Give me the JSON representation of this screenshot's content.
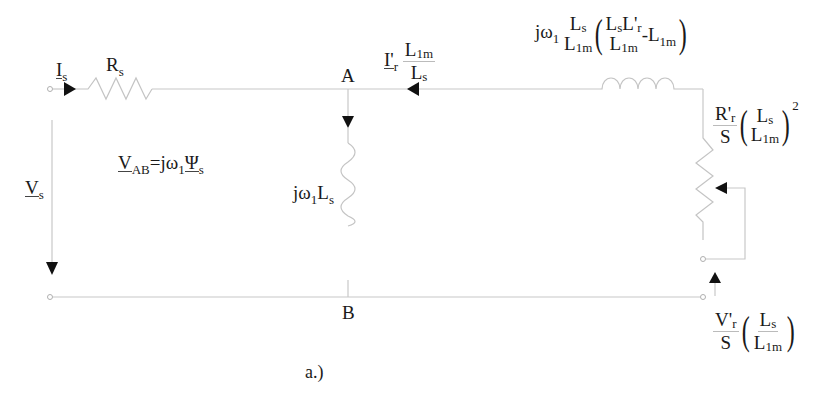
{
  "diagram": {
    "type": "induction-machine-equivalent-circuit",
    "caption": "a.)",
    "nodes": {
      "top": "A",
      "bottom": "B"
    },
    "labels": {
      "stator_current": {
        "main": "I",
        "sub": "s"
      },
      "stator_resistance": {
        "main": "R",
        "sub": "s"
      },
      "stator_voltage": {
        "main": "V",
        "sub": "s"
      },
      "vab_equation": {
        "lhs_main": "V",
        "lhs_sub": "AB",
        "eq": "=jω",
        "omega_sub": "1",
        "psi": "Ψ",
        "psi_sub": "s"
      },
      "magnetizing_inductance": {
        "prefix": "jω",
        "omega_sub": "1",
        "main": "L",
        "sub": "s"
      },
      "rotor_current": {
        "main": "I'",
        "sub": "r",
        "num_main": "L",
        "num_sub": "1m",
        "den_main": "L",
        "den_sub": "s"
      },
      "leakage_inductance": {
        "prefix": "jω",
        "omega_sub": "1",
        "frac_num_main": "L",
        "frac_num_sub": "s",
        "frac_den_main": "L",
        "frac_den_sub": "1m",
        "inner_num_a_main": "L",
        "inner_num_a_sub": "s",
        "inner_num_b_main": "L'",
        "inner_num_b_sub": "r",
        "inner_den_main": "L",
        "inner_den_sub": "1m",
        "minus_term": "-L",
        "minus_sub": "1m"
      },
      "rotor_resistance": {
        "num_main": "R'",
        "num_sub": "r",
        "den": "S",
        "inner_num_main": "L",
        "inner_num_sub": "s",
        "inner_den_main": "L",
        "inner_den_sub": "1m",
        "exponent": "2"
      },
      "rotor_voltage": {
        "num_main": "V'",
        "num_sub": "r",
        "den": "S",
        "inner_num_main": "L",
        "inner_num_sub": "s",
        "inner_den_main": "L",
        "inner_den_sub": "1m"
      }
    },
    "colors": {
      "wire": "#c8c8c8",
      "arrow": "#111111",
      "text": "#1a1a1a"
    }
  }
}
